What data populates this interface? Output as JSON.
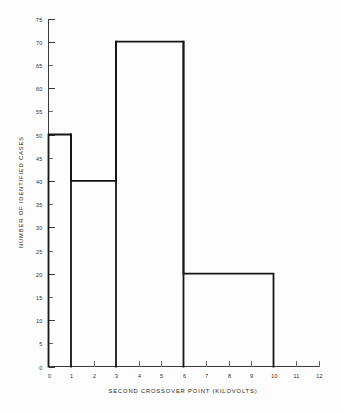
{
  "chart_data": {
    "type": "bar",
    "subtype": "histogram",
    "title": "",
    "xlabel": "SECOND CROSSOVER POINT (KILOVOLTS)",
    "ylabel": "NUMBER OF IDENTIFIED CASES",
    "xlim": [
      0,
      12
    ],
    "ylim": [
      0,
      75
    ],
    "grid": false,
    "legend": null,
    "x_ticks": [
      0,
      1,
      2,
      3,
      4,
      5,
      6,
      7,
      8,
      9,
      10,
      11,
      12
    ],
    "x_tick_labels": [
      "0",
      "1",
      "2",
      "3",
      "4",
      "5",
      "6",
      "7",
      "8",
      "9",
      "10",
      "11",
      "12"
    ],
    "y_ticks": [
      0,
      5,
      10,
      15,
      20,
      25,
      30,
      35,
      40,
      45,
      50,
      55,
      60,
      65,
      70,
      75
    ],
    "y_tick_labels": [
      "0",
      "5",
      "10",
      "15",
      "20",
      "25",
      "30",
      "35",
      "40",
      "45",
      "50",
      "55",
      "60",
      "65",
      "70",
      "75"
    ],
    "bins": [
      {
        "x_start": 0,
        "x_end": 1,
        "value": 50
      },
      {
        "x_start": 1,
        "x_end": 3,
        "value": 40
      },
      {
        "x_start": 3,
        "x_end": 6,
        "value": 70
      },
      {
        "x_start": 6,
        "x_end": 10,
        "value": 20
      }
    ],
    "categories": [
      "0-1",
      "1-3",
      "3-6",
      "6-10"
    ],
    "values": [
      50,
      40,
      70,
      20
    ]
  },
  "figure": {
    "background_color": "#fdfdfd",
    "line_color": "#151515",
    "axis_color": "#3a3a3a",
    "text_color": "#2a2a2a",
    "bottom_artifact_text": "              "
  }
}
